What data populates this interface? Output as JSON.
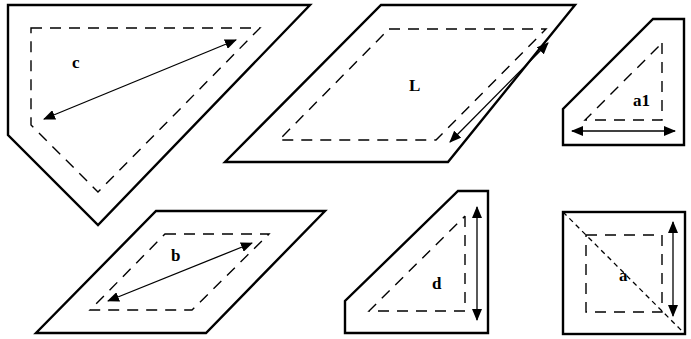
{
  "diagram": {
    "type": "quilt-template-pieces",
    "pieces": [
      {
        "id": "c",
        "label": "c",
        "shape": "pentagon",
        "label_pos": [
          72,
          68
        ]
      },
      {
        "id": "L",
        "label": "L",
        "shape": "parallelogram",
        "label_pos": [
          409,
          91
        ]
      },
      {
        "id": "a1",
        "label": "a1",
        "shape": "pentagon-small",
        "label_pos": [
          633,
          106
        ]
      },
      {
        "id": "b",
        "label": "b",
        "shape": "parallelogram",
        "label_pos": [
          171,
          261
        ]
      },
      {
        "id": "d",
        "label": "d",
        "shape": "pentagon-small",
        "label_pos": [
          432,
          289
        ]
      },
      {
        "id": "a",
        "label": "a",
        "shape": "square-with-diagonal",
        "label_pos": [
          619,
          281
        ]
      }
    ],
    "legend": {
      "solid_line": "cutting line",
      "dashed_line": "seam line",
      "arrow": "grain direction"
    }
  }
}
